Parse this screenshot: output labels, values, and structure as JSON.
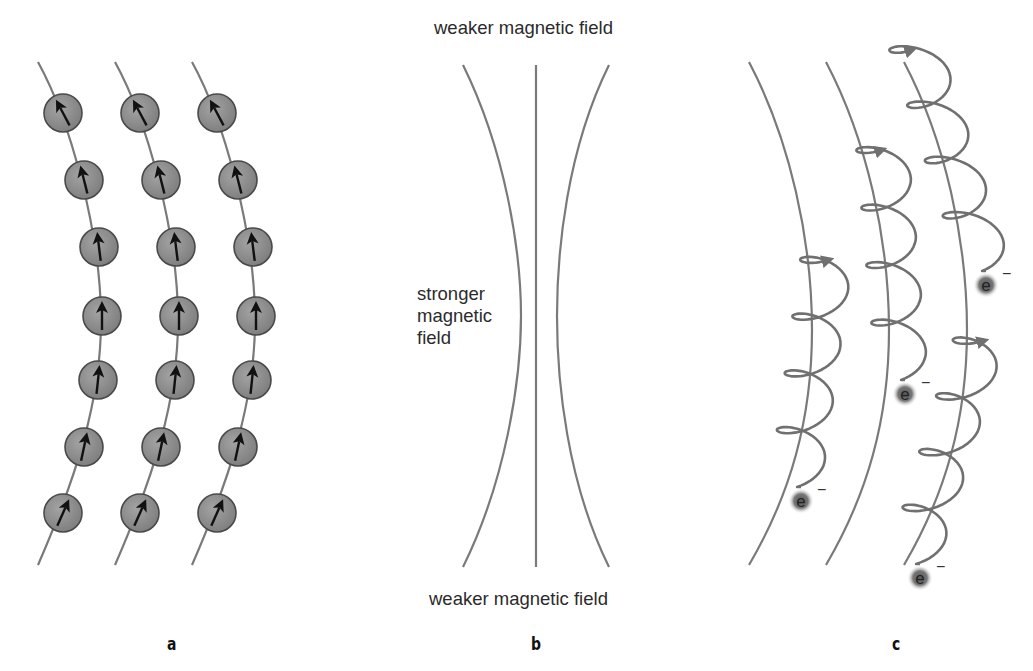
{
  "figure": {
    "panels": [
      {
        "id": "a",
        "label": "a",
        "description": "Aligned magnetic dipoles (atoms with spin arrows) along curved field lines"
      },
      {
        "id": "b",
        "label": "b",
        "description": "Converging magnetic field lines"
      },
      {
        "id": "c",
        "label": "c",
        "description": "Electrons spiraling along curved magnetic field lines"
      }
    ],
    "panel_b": {
      "top_label": "weaker magnetic field",
      "middle_label": "stronger magnetic field",
      "middle_lines": [
        "stronger",
        "magnetic",
        "field"
      ],
      "bottom_label": "weaker magnetic field"
    },
    "panel_c": {
      "electron_symbol": "e",
      "electron_charge": "−",
      "electron_count": 4
    },
    "panel_a": {
      "columns": 3,
      "atoms_per_column": 7
    },
    "colors": {
      "line": "#7a7a7a",
      "atom_fill": "#8c8c8c",
      "atom_stroke": "#4a4a4a",
      "arrow": "#111111",
      "text": "#2b2b2b",
      "electron_glow": "#6a6a6a"
    }
  }
}
